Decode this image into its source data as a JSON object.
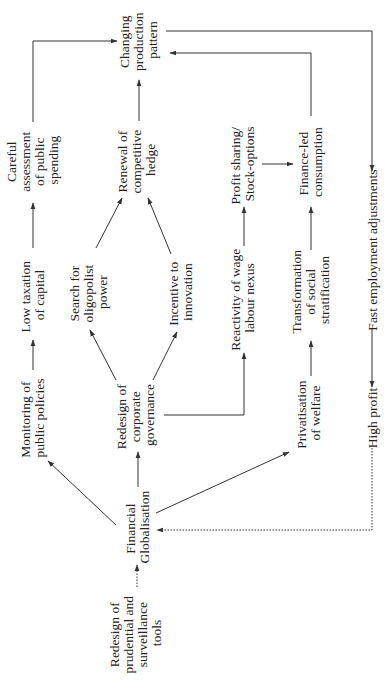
{
  "diagram": {
    "orientation": "rotated 90° counter-clockwise (text reads bottom-to-top)",
    "colors": {
      "line": "#333333",
      "text": "#222222",
      "background": "#ffffff"
    },
    "nodes": {
      "careful": {
        "lines": [
          "Careful",
          "assessment",
          "of public",
          "spending"
        ]
      },
      "changing": {
        "lines": [
          "Changing",
          "production",
          "pattern"
        ]
      },
      "low_tax": {
        "lines": [
          "Low taxation",
          "of capital"
        ]
      },
      "monitoring": {
        "lines": [
          "Monitoring of",
          "public policies"
        ]
      },
      "renewal": {
        "lines": [
          "Renewal of",
          "competitive",
          "hedge"
        ]
      },
      "search": {
        "lines": [
          "Search for",
          "oligopolist",
          "power"
        ]
      },
      "incentive": {
        "lines": [
          "Incentive to",
          "innovation"
        ]
      },
      "corp_gov": {
        "lines": [
          "Redesign of",
          "corporate",
          "governance"
        ]
      },
      "fin_glob": {
        "lines": [
          "Financial",
          "Globalisation"
        ]
      },
      "prudential": {
        "lines": [
          "Redesign of",
          "prudential and",
          "surveillance",
          "tools"
        ]
      },
      "profit_sharing": {
        "lines": [
          "Profit sharing/",
          "Stock-options"
        ]
      },
      "finance_led": {
        "lines": [
          "Finance-led",
          "consumption"
        ]
      },
      "reactivity": {
        "lines": [
          "Reactivity of wage",
          "labour nexus"
        ]
      },
      "transformation": {
        "lines": [
          "Transformation",
          "of social",
          "stratification"
        ]
      },
      "privatisation": {
        "lines": [
          "Privatisation",
          "of welfare"
        ]
      },
      "fast_employment": {
        "lines": [
          "Fast employment adjustments"
        ]
      },
      "high_profit": {
        "lines": [
          "High profit"
        ]
      }
    },
    "edges": [
      {
        "from": "prudential",
        "to": "fin_glob",
        "style": "dotted"
      },
      {
        "from": "fin_glob",
        "to": "monitoring",
        "style": "solid"
      },
      {
        "from": "fin_glob",
        "to": "corp_gov",
        "style": "solid"
      },
      {
        "from": "fin_glob",
        "to": "privatisation",
        "style": "solid"
      },
      {
        "from": "monitoring",
        "to": "low_tax",
        "style": "solid"
      },
      {
        "from": "low_tax",
        "to": "careful",
        "style": "solid"
      },
      {
        "from": "careful",
        "to": "changing",
        "style": "solid"
      },
      {
        "from": "corp_gov",
        "to": "search",
        "style": "solid"
      },
      {
        "from": "corp_gov",
        "to": "incentive",
        "style": "solid"
      },
      {
        "from": "corp_gov",
        "to": "reactivity",
        "style": "solid"
      },
      {
        "from": "search",
        "to": "renewal",
        "style": "solid"
      },
      {
        "from": "incentive",
        "to": "renewal",
        "style": "solid"
      },
      {
        "from": "renewal",
        "to": "changing",
        "style": "solid"
      },
      {
        "from": "reactivity",
        "to": "profit_sharing",
        "style": "solid"
      },
      {
        "from": "profit_sharing",
        "to": "finance_led",
        "style": "solid"
      },
      {
        "from": "privatisation",
        "to": "transformation",
        "style": "solid"
      },
      {
        "from": "transformation",
        "to": "finance_led",
        "style": "solid"
      },
      {
        "from": "finance_led",
        "to": "changing",
        "style": "solid"
      },
      {
        "from": "changing",
        "to": "fast_employment",
        "style": "solid"
      },
      {
        "from": "fast_employment",
        "to": "high_profit",
        "style": "solid"
      },
      {
        "from": "high_profit",
        "to": "fin_glob",
        "style": "dotted"
      }
    ]
  }
}
